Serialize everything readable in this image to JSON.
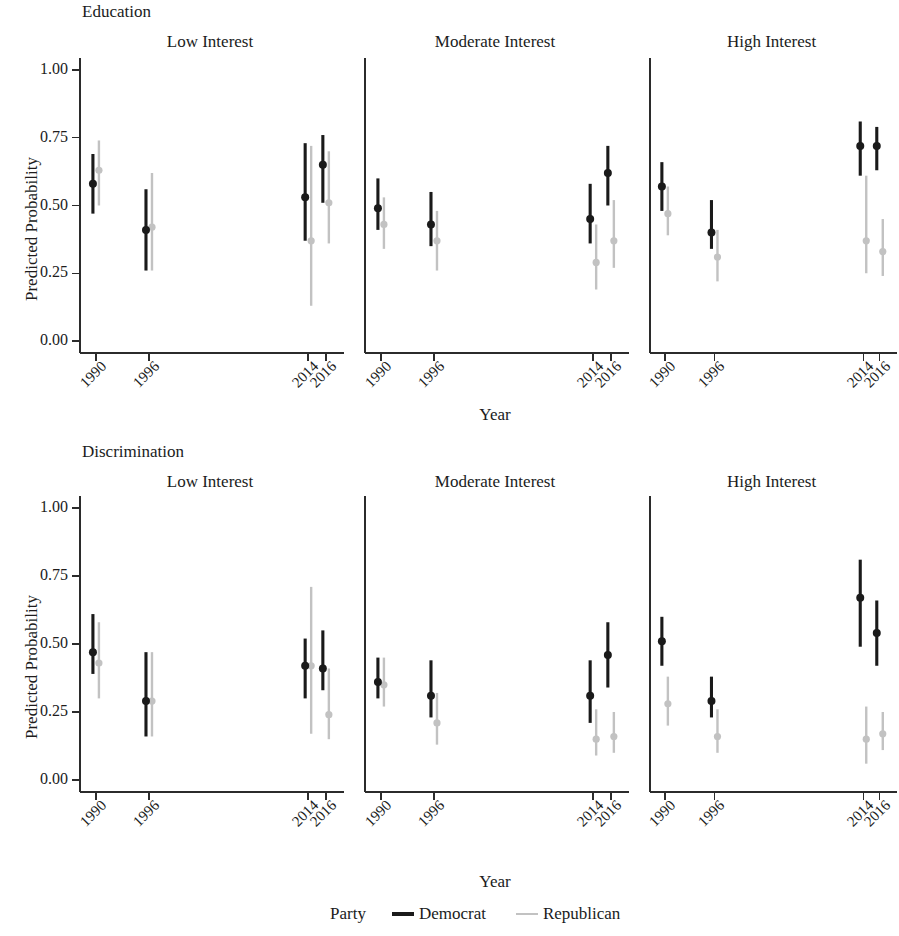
{
  "figure": {
    "width": 899,
    "height": 936,
    "background": "#ffffff"
  },
  "rows": [
    {
      "label": "Education"
    },
    {
      "label": "Discrimination"
    }
  ],
  "panel_titles": [
    "Low Interest",
    "Moderate Interest",
    "High Interest"
  ],
  "axis": {
    "ylabel": "Predicted Probability",
    "xlabel": "Year",
    "ytick_labels": [
      "1.00",
      "0.75",
      "0.50",
      "0.25",
      "0.00"
    ],
    "ytick_values": [
      1.0,
      0.75,
      0.5,
      0.25,
      0.0
    ],
    "xtick_labels": [
      "1990",
      "1996",
      "2014",
      "2016"
    ],
    "xtick_values": [
      1990,
      1996,
      2014,
      2016
    ],
    "ylim": [
      0.0,
      1.0
    ],
    "xlim": [
      1988,
      2018
    ],
    "grid": false
  },
  "legend": {
    "title": "Party",
    "position": "bottom-center",
    "entries": [
      {
        "label": "Democrat",
        "color": "#1a1a1a"
      },
      {
        "label": "Republican",
        "color": "#c2c2c2"
      }
    ]
  },
  "colors": {
    "democrat": "#1a1a1a",
    "republican": "#c2c2c2",
    "axis": "#2b2b2b",
    "text": "#201c1c"
  },
  "chart_data": {
    "type": "scatter",
    "title": "",
    "xlabel": "Year",
    "ylabel": "Predicted Probability",
    "ylim": [
      0.0,
      1.0
    ],
    "x": [
      1990,
      1996,
      2014,
      2016
    ],
    "grid": false,
    "legend_position": "bottom-center",
    "panels": [
      {
        "row": "Education",
        "column": "Low Interest",
        "series": [
          {
            "name": "Democrat",
            "color": "#1a1a1a",
            "points": [
              {
                "x": 1990,
                "y": 0.58,
                "lo": 0.47,
                "hi": 0.69
              },
              {
                "x": 1996,
                "y": 0.41,
                "lo": 0.26,
                "hi": 0.56
              },
              {
                "x": 2014,
                "y": 0.53,
                "lo": 0.37,
                "hi": 0.73
              },
              {
                "x": 2016,
                "y": 0.65,
                "lo": 0.51,
                "hi": 0.76
              }
            ]
          },
          {
            "name": "Republican",
            "color": "#c2c2c2",
            "points": [
              {
                "x": 1990,
                "y": 0.63,
                "lo": 0.5,
                "hi": 0.74
              },
              {
                "x": 1996,
                "y": 0.42,
                "lo": 0.26,
                "hi": 0.62
              },
              {
                "x": 2014,
                "y": 0.37,
                "lo": 0.13,
                "hi": 0.72
              },
              {
                "x": 2016,
                "y": 0.51,
                "lo": 0.36,
                "hi": 0.7
              }
            ]
          }
        ]
      },
      {
        "row": "Education",
        "column": "Moderate Interest",
        "series": [
          {
            "name": "Democrat",
            "color": "#1a1a1a",
            "points": [
              {
                "x": 1990,
                "y": 0.49,
                "lo": 0.41,
                "hi": 0.6
              },
              {
                "x": 1996,
                "y": 0.43,
                "lo": 0.35,
                "hi": 0.55
              },
              {
                "x": 2014,
                "y": 0.45,
                "lo": 0.36,
                "hi": 0.58
              },
              {
                "x": 2016,
                "y": 0.62,
                "lo": 0.5,
                "hi": 0.72
              }
            ]
          },
          {
            "name": "Republican",
            "color": "#c2c2c2",
            "points": [
              {
                "x": 1990,
                "y": 0.43,
                "lo": 0.34,
                "hi": 0.53
              },
              {
                "x": 1996,
                "y": 0.37,
                "lo": 0.26,
                "hi": 0.48
              },
              {
                "x": 2014,
                "y": 0.29,
                "lo": 0.19,
                "hi": 0.43
              },
              {
                "x": 2016,
                "y": 0.37,
                "lo": 0.27,
                "hi": 0.52
              }
            ]
          }
        ]
      },
      {
        "row": "Education",
        "column": "High Interest",
        "series": [
          {
            "name": "Democrat",
            "color": "#1a1a1a",
            "points": [
              {
                "x": 1990,
                "y": 0.57,
                "lo": 0.48,
                "hi": 0.66
              },
              {
                "x": 1996,
                "y": 0.4,
                "lo": 0.34,
                "hi": 0.52
              },
              {
                "x": 2014,
                "y": 0.72,
                "lo": 0.61,
                "hi": 0.81
              },
              {
                "x": 2016,
                "y": 0.72,
                "lo": 0.63,
                "hi": 0.79
              }
            ]
          },
          {
            "name": "Republican",
            "color": "#c2c2c2",
            "points": [
              {
                "x": 1990,
                "y": 0.47,
                "lo": 0.39,
                "hi": 0.57
              },
              {
                "x": 1996,
                "y": 0.31,
                "lo": 0.22,
                "hi": 0.41
              },
              {
                "x": 2014,
                "y": 0.37,
                "lo": 0.25,
                "hi": 0.61
              },
              {
                "x": 2016,
                "y": 0.33,
                "lo": 0.24,
                "hi": 0.45
              }
            ]
          }
        ]
      },
      {
        "row": "Discrimination",
        "column": "Low Interest",
        "series": [
          {
            "name": "Democrat",
            "color": "#1a1a1a",
            "points": [
              {
                "x": 1990,
                "y": 0.47,
                "lo": 0.39,
                "hi": 0.61
              },
              {
                "x": 1996,
                "y": 0.29,
                "lo": 0.16,
                "hi": 0.47
              },
              {
                "x": 2014,
                "y": 0.42,
                "lo": 0.3,
                "hi": 0.52
              },
              {
                "x": 2016,
                "y": 0.41,
                "lo": 0.33,
                "hi": 0.55
              }
            ]
          },
          {
            "name": "Republican",
            "color": "#c2c2c2",
            "points": [
              {
                "x": 1990,
                "y": 0.43,
                "lo": 0.3,
                "hi": 0.58
              },
              {
                "x": 1996,
                "y": 0.29,
                "lo": 0.16,
                "hi": 0.47
              },
              {
                "x": 2014,
                "y": 0.42,
                "lo": 0.17,
                "hi": 0.71
              },
              {
                "x": 2016,
                "y": 0.24,
                "lo": 0.15,
                "hi": 0.41
              }
            ]
          }
        ]
      },
      {
        "row": "Discrimination",
        "column": "Moderate Interest",
        "series": [
          {
            "name": "Democrat",
            "color": "#1a1a1a",
            "points": [
              {
                "x": 1990,
                "y": 0.36,
                "lo": 0.3,
                "hi": 0.45
              },
              {
                "x": 1996,
                "y": 0.31,
                "lo": 0.23,
                "hi": 0.44
              },
              {
                "x": 2014,
                "y": 0.31,
                "lo": 0.21,
                "hi": 0.44
              },
              {
                "x": 2016,
                "y": 0.46,
                "lo": 0.34,
                "hi": 0.58
              }
            ]
          },
          {
            "name": "Republican",
            "color": "#c2c2c2",
            "points": [
              {
                "x": 1990,
                "y": 0.35,
                "lo": 0.27,
                "hi": 0.45
              },
              {
                "x": 1996,
                "y": 0.21,
                "lo": 0.13,
                "hi": 0.32
              },
              {
                "x": 2014,
                "y": 0.15,
                "lo": 0.09,
                "hi": 0.26
              },
              {
                "x": 2016,
                "y": 0.16,
                "lo": 0.1,
                "hi": 0.25
              }
            ]
          }
        ]
      },
      {
        "row": "Discrimination",
        "column": "High Interest",
        "series": [
          {
            "name": "Democrat",
            "color": "#1a1a1a",
            "points": [
              {
                "x": 1990,
                "y": 0.51,
                "lo": 0.42,
                "hi": 0.6
              },
              {
                "x": 1996,
                "y": 0.29,
                "lo": 0.23,
                "hi": 0.38
              },
              {
                "x": 2014,
                "y": 0.67,
                "lo": 0.49,
                "hi": 0.81
              },
              {
                "x": 2016,
                "y": 0.54,
                "lo": 0.42,
                "hi": 0.66
              }
            ]
          },
          {
            "name": "Republican",
            "color": "#c2c2c2",
            "points": [
              {
                "x": 1990,
                "y": 0.28,
                "lo": 0.2,
                "hi": 0.38
              },
              {
                "x": 1996,
                "y": 0.16,
                "lo": 0.1,
                "hi": 0.26
              },
              {
                "x": 2014,
                "y": 0.15,
                "lo": 0.06,
                "hi": 0.27
              },
              {
                "x": 2016,
                "y": 0.17,
                "lo": 0.11,
                "hi": 0.25
              }
            ]
          }
        ]
      }
    ]
  }
}
